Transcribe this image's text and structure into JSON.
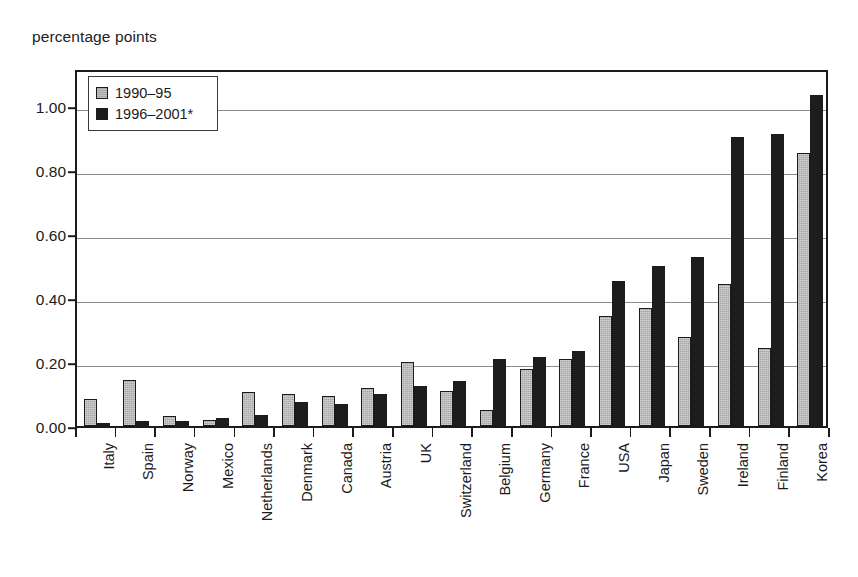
{
  "chart_data": {
    "type": "bar",
    "title": "",
    "ylabel": "percentage points",
    "xlabel": "",
    "ylim": [
      0.0,
      1.12
    ],
    "yticks": [
      "0.00",
      "0.20",
      "0.40",
      "0.60",
      "0.80",
      "1.00"
    ],
    "ytick_values": [
      0.0,
      0.2,
      0.4,
      0.6,
      0.8,
      1.0
    ],
    "grid": true,
    "legend_position": "top-left",
    "categories": [
      "Italy",
      "Spain",
      "Norway",
      "Mexico",
      "Netherlands",
      "Denmark",
      "Canada",
      "Austria",
      "UK",
      "Switzerland",
      "Belgium",
      "Germany",
      "France",
      "USA",
      "Japan",
      "Sweden",
      "Ireland",
      "Finland",
      "Korea"
    ],
    "series": [
      {
        "name": "1990–95",
        "color": "#a7a7a7",
        "values": [
          0.085,
          0.145,
          0.03,
          0.02,
          0.105,
          0.1,
          0.095,
          0.12,
          0.2,
          0.11,
          0.05,
          0.18,
          0.21,
          0.345,
          0.37,
          0.28,
          0.445,
          0.245,
          0.855
        ]
      },
      {
        "name": "1996–2001*",
        "color": "#1d1d1d",
        "values": [
          0.01,
          0.015,
          0.015,
          0.025,
          0.035,
          0.075,
          0.07,
          0.1,
          0.125,
          0.14,
          0.21,
          0.215,
          0.235,
          0.455,
          0.5,
          0.53,
          0.905,
          0.915,
          1.035
        ]
      }
    ]
  }
}
